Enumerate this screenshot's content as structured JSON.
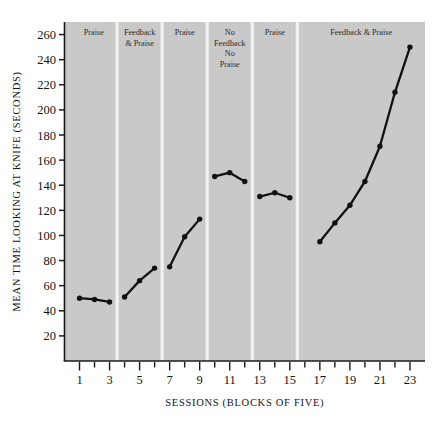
{
  "figure": {
    "title": "",
    "plot_bg_color": "#c9c9c9",
    "divider_color": "#f2f2f2",
    "axis_color": "#1a1a1a",
    "line_color": "#111111",
    "marker_color": "#111111"
  },
  "chart_data": {
    "type": "line",
    "title": "",
    "xlabel": "SESSIONS (BLOCKS OF FIVE)",
    "ylabel": "MEAN TIME LOOKING AT KNIFE (SECONDS)",
    "xlim": [
      0,
      24
    ],
    "ylim": [
      0,
      270
    ],
    "ytick_values": [
      20,
      40,
      60,
      80,
      100,
      120,
      140,
      160,
      180,
      200,
      220,
      240,
      260
    ],
    "ytick_labels": [
      "20",
      "40",
      "60",
      "80",
      "100",
      "120",
      "140",
      "160",
      "180",
      "200",
      "220",
      "240",
      "260"
    ],
    "xtick_values": [
      1,
      2,
      3,
      4,
      5,
      6,
      7,
      8,
      9,
      10,
      11,
      12,
      13,
      14,
      15,
      16,
      17,
      18,
      19,
      20,
      21,
      22,
      23
    ],
    "xtick_labels": [
      "1",
      "",
      "3",
      "",
      "5",
      "",
      "7",
      "",
      "9",
      "",
      "11",
      "",
      "13",
      "",
      "15",
      "",
      "17",
      "",
      "19",
      "",
      "21",
      "",
      "23"
    ],
    "grid": false,
    "legend": "none",
    "x": [
      1,
      2,
      3,
      4,
      5,
      6,
      7,
      8,
      9,
      10,
      11,
      12,
      13,
      14,
      15,
      16,
      17,
      18,
      19,
      20,
      21,
      22,
      23
    ],
    "values": [
      50,
      49,
      47,
      51,
      64,
      74,
      75,
      99,
      113,
      147,
      150,
      143,
      131,
      134,
      130,
      null,
      95,
      110,
      124,
      143,
      171,
      214,
      250
    ],
    "segments": [
      {
        "x": [
          1,
          2,
          3
        ],
        "y": [
          50,
          49,
          47
        ]
      },
      {
        "x": [
          4,
          5,
          6
        ],
        "y": [
          51,
          64,
          74
        ]
      },
      {
        "x": [
          7,
          8,
          9
        ],
        "y": [
          75,
          99,
          113
        ]
      },
      {
        "x": [
          10,
          11,
          12
        ],
        "y": [
          147,
          150,
          143
        ]
      },
      {
        "x": [
          13,
          14,
          15
        ],
        "y": [
          131,
          134,
          130
        ]
      },
      {
        "x": [
          17,
          18,
          19,
          20,
          21,
          22,
          23
        ],
        "y": [
          95,
          110,
          124,
          143,
          171,
          214,
          250
        ]
      }
    ],
    "phases": [
      {
        "label": "Praise",
        "lines": [
          "Praise"
        ],
        "x_start": 0.4,
        "x_end": 3.5
      },
      {
        "label": "Feedback & Praise",
        "lines": [
          "Feedback",
          "& Praise"
        ],
        "x_start": 3.5,
        "x_end": 6.5
      },
      {
        "label": "Praise",
        "lines": [
          "Praise"
        ],
        "x_start": 6.5,
        "x_end": 9.5
      },
      {
        "label": "No Feedback No Praise",
        "lines": [
          "No",
          "Feedback",
          "No",
          "Praise"
        ],
        "x_start": 9.5,
        "x_end": 12.5
      },
      {
        "label": "Praise",
        "lines": [
          "Praise"
        ],
        "x_start": 12.5,
        "x_end": 15.5
      },
      {
        "label": "Feedback & Praise",
        "lines": [
          "Feedback & Praise"
        ],
        "x_start": 15.5,
        "x_end": 24.0
      }
    ]
  }
}
